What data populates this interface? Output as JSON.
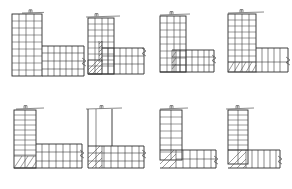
{
  "sheet": {
    "title": "Reinforcement Corner Detail Sheet",
    "background_color": "#ffffff",
    "line_color": "#3a3a3a",
    "bold_line_color": "#2b2b2b",
    "width": 292,
    "height": 189,
    "rows": 2,
    "columns": 4,
    "total_figures": 8
  },
  "figures": [
    {
      "id": "fig-1",
      "index": "1",
      "caption": "",
      "shape": "L-corner",
      "origin": {
        "x": 12,
        "y": 12
      },
      "column": {
        "x": 12,
        "y": 14,
        "width": 30,
        "height": 62,
        "rungs": 9,
        "verticals": 4
      },
      "beam": {
        "x": 42,
        "y": 46,
        "width": 42,
        "height": 30,
        "rungs": 7,
        "horizontals": 3
      },
      "hatched_zone": null,
      "top_hook": {
        "x": 30,
        "y": 11,
        "style": "anchor-hook"
      },
      "top_rail": {
        "x1": 22,
        "y1": 13,
        "x2": 44,
        "y2": 12
      },
      "break_symbol": {
        "x": 84,
        "y": 62,
        "style": "zigzag-right"
      },
      "notes": "Dense stirrup grid in column and beam, no hatching"
    },
    {
      "id": "fig-2",
      "index": "2",
      "caption": "",
      "shape": "L-corner",
      "origin": {
        "x": 84,
        "y": 12
      },
      "column": {
        "x": 88,
        "y": 16,
        "width": 26,
        "height": 58,
        "rungs": 10,
        "verticals": 4
      },
      "beam": {
        "x": 96,
        "y": 48,
        "width": 48,
        "height": 26,
        "rungs": 9,
        "horizontals": 3
      },
      "hatched_zone": {
        "x": 88,
        "y": 58,
        "width": 14,
        "height": 16,
        "angle": 45,
        "lines": 4
      },
      "top_hook": {
        "x": 98,
        "y": 15,
        "style": "anchor-hook"
      },
      "top_rail": {
        "x1": 88,
        "y1": 17,
        "x2": 118,
        "y2": 16
      },
      "break_symbol": {
        "x": 144,
        "y": 52,
        "style": "zigzag-right"
      },
      "notes": "Hatched anchorage block at joint base, vertical hatch strip mid-column"
    },
    {
      "id": "fig-3",
      "index": "3",
      "caption": "",
      "shape": "L-corner",
      "origin": {
        "x": 156,
        "y": 12
      },
      "column": {
        "x": 160,
        "y": 14,
        "width": 26,
        "height": 58,
        "rungs": 9,
        "verticals": 4
      },
      "beam": {
        "x": 172,
        "y": 50,
        "width": 42,
        "height": 22,
        "rungs": 8,
        "horizontals": 3
      },
      "hatched_zone": {
        "x": 172,
        "y": 50,
        "width": 8,
        "height": 22,
        "angle": 45,
        "lines": 3
      },
      "top_hook": {
        "x": 172,
        "y": 13,
        "style": "anchor-hook"
      },
      "top_rail": {
        "x1": 162,
        "y1": 15,
        "x2": 190,
        "y2": 14
      },
      "break_symbol": {
        "x": 214,
        "y": 58,
        "style": "zigzag-right"
      },
      "notes": "Narrow hatch column at beam-column interface"
    },
    {
      "id": "fig-4",
      "index": "4",
      "caption": "",
      "shape": "L-corner",
      "origin": {
        "x": 224,
        "y": 12
      },
      "column": {
        "x": 228,
        "y": 14,
        "width": 28,
        "height": 58,
        "rungs": 10,
        "verticals": 4
      },
      "beam": {
        "x": 256,
        "y": 48,
        "width": 32,
        "height": 24,
        "rungs": 6,
        "horizontals": 2
      },
      "hatched_zone": {
        "x": 228,
        "y": 62,
        "width": 28,
        "height": 10,
        "angle": 45,
        "lines": 5
      },
      "top_hook": {
        "x": 242,
        "y": 11,
        "style": "anchor-hook"
      },
      "top_rail": {
        "x1": 230,
        "y1": 13,
        "x2": 262,
        "y2": 12
      },
      "break_symbol": {
        "x": 288,
        "y": 60,
        "style": "zigzag-right"
      },
      "notes": "Wide horizontal hatched band under column base"
    },
    {
      "id": "fig-5",
      "index": "5",
      "caption": "",
      "shape": "L-corner",
      "origin": {
        "x": 12,
        "y": 106
      },
      "column": {
        "x": 14,
        "y": 110,
        "width": 22,
        "height": 58,
        "rungs": 12,
        "verticals": 3
      },
      "beam": {
        "x": 36,
        "y": 144,
        "width": 46,
        "height": 24,
        "rungs": 7,
        "horizontals": 2
      },
      "hatched_zone": {
        "x": 14,
        "y": 156,
        "width": 22,
        "height": 12,
        "angle": 45,
        "lines": 5
      },
      "top_hook": {
        "x": 26,
        "y": 107,
        "style": "anchor-hook"
      },
      "top_rail": {
        "x1": 16,
        "y1": 109,
        "x2": 42,
        "y2": 108
      },
      "break_symbol": {
        "x": 82,
        "y": 152,
        "style": "zigzag-right"
      },
      "notes": "Tall narrow ladder column with hatched base block"
    },
    {
      "id": "fig-6",
      "index": "6",
      "caption": "",
      "shape": "L-corner",
      "origin": {
        "x": 84,
        "y": 106
      },
      "column": {
        "x": 88,
        "y": 110,
        "width": 24,
        "height": 50,
        "rungs": 0,
        "verticals": 3
      },
      "beam": {
        "x": 88,
        "y": 144,
        "width": 56,
        "height": 24,
        "rungs": 8,
        "horizontals": 3
      },
      "hatched_zone": {
        "x": 88,
        "y": 144,
        "width": 14,
        "height": 24,
        "angle": 45,
        "lines": 5
      },
      "top_hook": {
        "x": 102,
        "y": 107,
        "style": "anchor-hook"
      },
      "top_rail": {
        "x1": 88,
        "y1": 109,
        "x2": 118,
        "y2": 108
      },
      "break_symbol": {
        "x": 144,
        "y": 152,
        "style": "zigzag-right"
      },
      "notes": "Plain longitudinal bars in column (no stirrups shown), hatched joint zone"
    },
    {
      "id": "fig-7",
      "index": "7",
      "caption": "",
      "shape": "L-corner",
      "origin": {
        "x": 156,
        "y": 106
      },
      "column": {
        "x": 160,
        "y": 110,
        "width": 22,
        "height": 50,
        "rungs": 8,
        "verticals": 3
      },
      "beam": {
        "x": 160,
        "y": 150,
        "width": 56,
        "height": 18,
        "rungs": 6,
        "horizontals": 2
      },
      "hatched_zone": {
        "x": 160,
        "y": 150,
        "width": 16,
        "height": 18,
        "angle": 45,
        "lines": 3
      },
      "top_hook": {
        "x": 172,
        "y": 107,
        "style": "anchor-hook"
      },
      "top_rail": {
        "x1": 162,
        "y1": 109,
        "x2": 186,
        "y2": 108
      },
      "break_symbol": {
        "x": 216,
        "y": 158,
        "style": "zigzag-right"
      },
      "notes": "Corner hatch wedge with long beam run"
    },
    {
      "id": "fig-8",
      "index": "8",
      "caption": "",
      "shape": "L-corner",
      "origin": {
        "x": 224,
        "y": 106
      },
      "column": {
        "x": 228,
        "y": 110,
        "width": 20,
        "height": 54,
        "rungs": 11,
        "verticals": 2
      },
      "beam": {
        "x": 228,
        "y": 150,
        "width": 52,
        "height": 18,
        "rungs": 6,
        "horizontals": 2
      },
      "hatched_zone": {
        "x": 228,
        "y": 150,
        "width": 18,
        "height": 18,
        "angle": 45,
        "lines": 4
      },
      "top_hook": {
        "x": 238,
        "y": 107,
        "style": "anchor-hook"
      },
      "top_rail": {
        "x1": 228,
        "y1": 109,
        "x2": 252,
        "y2": 108
      },
      "break_symbol": {
        "x": 282,
        "y": 158,
        "style": "zigzag-right"
      },
      "notes": "Narrow ladder column, hatched corner wedge, ribbed beam"
    }
  ],
  "legend": {
    "hatch_meaning": "anchorage / development length zone",
    "break_symbol_meaning": "member continues",
    "hook_symbol_meaning": "standard bar hook"
  }
}
